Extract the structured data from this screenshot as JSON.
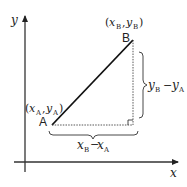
{
  "diagram": {
    "axes": {
      "x_label": "x",
      "y_label": "y"
    },
    "points": [
      {
        "id": "A",
        "label": "A",
        "coord_label": "(x_A, y_A)",
        "x_var": "x",
        "x_sub": "A",
        "y_var": "y",
        "y_sub": "A"
      },
      {
        "id": "B",
        "label": "B",
        "coord_label": "(x_B, y_B)",
        "x_var": "x",
        "x_sub": "B",
        "y_var": "y",
        "y_sub": "B"
      }
    ],
    "horizontal_difference": {
      "label": "x_B − x_A",
      "term1_var": "x",
      "term1_sub": "B",
      "operator": "−",
      "term2_var": "x",
      "term2_sub": "A"
    },
    "vertical_difference": {
      "label": "y_B − y_A",
      "term1_var": "y",
      "term1_sub": "B",
      "operator": "−",
      "term2_var": "y",
      "term2_sub": "A"
    },
    "colors": {
      "stroke": "#222222",
      "background": "#ffffff"
    }
  }
}
